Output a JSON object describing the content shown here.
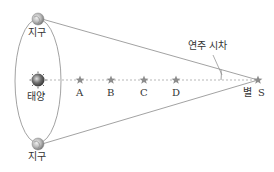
{
  "diagram": {
    "topic": "annual-parallax",
    "colors": {
      "line": "#8a8a8a",
      "dashed": "#9a9a9a",
      "star": "#8c8c8c",
      "text": "#333333",
      "earth": "#b0b0b0",
      "sun": "#6a6a6a"
    },
    "earth_top": {
      "label": "지구"
    },
    "earth_bottom": {
      "label": "지구"
    },
    "sun": {
      "label": "태양"
    },
    "stars": [
      {
        "label": "A"
      },
      {
        "label": "B"
      },
      {
        "label": "C"
      },
      {
        "label": "D"
      }
    ],
    "target_star": {
      "prefix": "별",
      "label": "S"
    },
    "parallax_label": "연주 시차"
  }
}
